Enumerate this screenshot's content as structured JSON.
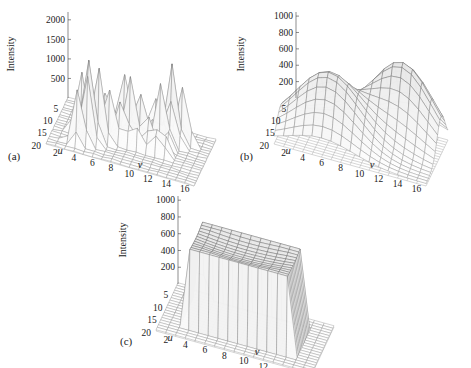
{
  "figure": {
    "background": "#ffffff",
    "line_color": "#8d8d8d",
    "text_color": "#1a1a1a"
  },
  "panels": [
    {
      "id": "a",
      "caption": "(a)",
      "zlabel": "Intensity",
      "xlabel": "u",
      "ylabel": "v",
      "zticks": [
        "500",
        "1000",
        "1500",
        "2000"
      ],
      "uticks": [
        "5",
        "10",
        "15",
        "20"
      ],
      "vticks": [
        "16",
        "14",
        "12",
        "10",
        "8",
        "6",
        "4",
        "2"
      ]
    },
    {
      "id": "b",
      "caption": "(b)",
      "zlabel": "Intensity",
      "xlabel": "u",
      "ylabel": "v",
      "zticks": [
        "200",
        "400",
        "600",
        "800",
        "1000"
      ],
      "uticks": [
        "5",
        "10",
        "15",
        "20"
      ],
      "vticks": [
        "16",
        "14",
        "12",
        "10",
        "8",
        "6",
        "4",
        "2"
      ]
    },
    {
      "id": "c",
      "caption": "(c)",
      "zlabel": "Intensity",
      "xlabel": "u",
      "ylabel": "v",
      "zticks": [
        "200",
        "400",
        "600",
        "800",
        "1000"
      ],
      "uticks": [
        "5",
        "10",
        "15",
        "20"
      ],
      "vticks": [
        "16",
        "14",
        "12",
        "10",
        "8",
        "6",
        "4",
        "2"
      ]
    }
  ],
  "chart_data": [
    {
      "type": "surface",
      "panel": "a",
      "title": "",
      "xlabel": "u",
      "ylabel": "v",
      "zlabel": "Intensity",
      "xlim": [
        1,
        20
      ],
      "ylim": [
        1,
        17
      ],
      "zlim": [
        0,
        2200
      ],
      "xticks": [
        5,
        10,
        15,
        20
      ],
      "yticks": [
        16,
        14,
        12,
        10,
        8,
        6,
        4,
        2
      ],
      "zticks": [
        500,
        1000,
        1500,
        2000
      ],
      "grid": true,
      "legend": "none",
      "description": "Noisy speckled intensity surface with tall narrow spikes reaching about 2100 on a near-zero baseline plane.",
      "nu": 20,
      "nv": 17,
      "peak_value": 2100,
      "baseline": 40,
      "spikes": [
        {
          "u": 6,
          "v": 14,
          "z": 1450
        },
        {
          "u": 7,
          "v": 13,
          "z": 2050
        },
        {
          "u": 8,
          "v": 13,
          "z": 1150
        },
        {
          "u": 9,
          "v": 12,
          "z": 1600
        },
        {
          "u": 5,
          "v": 11,
          "z": 900
        },
        {
          "u": 10,
          "v": 10,
          "z": 1250
        },
        {
          "u": 11,
          "v": 9,
          "z": 1700
        },
        {
          "u": 12,
          "v": 8,
          "z": 1050
        },
        {
          "u": 8,
          "v": 8,
          "z": 1500
        },
        {
          "u": 13,
          "v": 7,
          "z": 1350
        },
        {
          "u": 14,
          "v": 6,
          "z": 1900
        },
        {
          "u": 15,
          "v": 5,
          "z": 2100
        },
        {
          "u": 16,
          "v": 5,
          "z": 1750
        },
        {
          "u": 13,
          "v": 4,
          "z": 1600
        },
        {
          "u": 17,
          "v": 4,
          "z": 1400
        },
        {
          "u": 11,
          "v": 11,
          "z": 800
        },
        {
          "u": 9,
          "v": 6,
          "z": 950
        }
      ]
    },
    {
      "type": "surface",
      "panel": "b",
      "title": "",
      "xlabel": "u",
      "ylabel": "v",
      "zlabel": "Intensity",
      "xlim": [
        1,
        20
      ],
      "ylim": [
        1,
        17
      ],
      "zlim": [
        0,
        1050
      ],
      "xticks": [
        5,
        10,
        15,
        20
      ],
      "yticks": [
        16,
        14,
        12,
        10,
        8,
        6,
        4,
        2
      ],
      "zticks": [
        200,
        400,
        600,
        800,
        1000
      ],
      "grid": true,
      "legend": "none",
      "description": "Smooth bimodal mesh surface with two broad rounded ridges peaking near 950 and 800, separated by a saddle valley near 450.",
      "nu": 20,
      "nv": 17,
      "peak_value": 950,
      "baseline": 30,
      "modes": [
        {
          "u": 7,
          "v": 13,
          "z": 950,
          "su": 3.4,
          "sv": 3.2
        },
        {
          "u": 14,
          "v": 6,
          "z": 820,
          "su": 3.6,
          "sv": 3.4
        }
      ]
    },
    {
      "type": "surface",
      "panel": "c",
      "title": "",
      "xlabel": "u",
      "ylabel": "v",
      "zlabel": "Intensity",
      "xlim": [
        1,
        20
      ],
      "ylim": [
        1,
        17
      ],
      "zlim": [
        0,
        1050
      ],
      "xticks": [
        5,
        10,
        15,
        20
      ],
      "yticks": [
        16,
        14,
        12,
        10,
        8,
        6,
        4,
        2
      ],
      "zticks": [
        200,
        400,
        600,
        800,
        1000
      ],
      "grid": true,
      "legend": "none",
      "description": "Flat-topped plateau (mesa) surface clipped near 900-1000 with steep near-vertical walls dropping to a near-zero baseline plane.",
      "nu": 20,
      "nv": 17,
      "plateau_value": 930,
      "plateau_u": [
        5,
        16
      ],
      "plateau_v": [
        4,
        14
      ],
      "baseline": 25
    }
  ]
}
